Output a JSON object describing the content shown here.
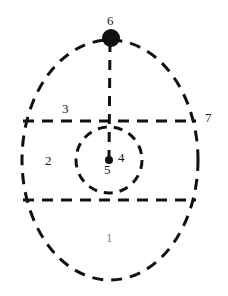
{
  "figure": {
    "title": "",
    "background_color": "#ffffff",
    "stroke_color": "#111111",
    "label_color": "#1a1a1a",
    "faint_label_color": "#8a8a8a"
  },
  "shapes": {
    "outer_ellipse": {
      "name": "outer-ellipse",
      "center_x": 110,
      "center_y": 160,
      "radius_x": 88,
      "radius_y": 120,
      "style": "dashed"
    },
    "inner_circle": {
      "name": "inner-circle",
      "center_x": 109,
      "center_y": 160,
      "radius": 33,
      "style": "dashed"
    },
    "upper_horizontal_line": {
      "name": "upper-horizontal-line",
      "x1": 23,
      "y1": 121,
      "x2": 196,
      "y2": 121,
      "style": "dashed"
    },
    "lower_horizontal_line": {
      "name": "lower-horizontal-line",
      "x1": 23,
      "y1": 200,
      "x2": 196,
      "y2": 200,
      "style": "dashed"
    },
    "vertical_line": {
      "name": "vertical-axis-line",
      "x1": 110,
      "y1": 42,
      "x2": 109,
      "y2": 160,
      "style": "dashed"
    },
    "top_dot": {
      "name": "top-vertex-dot",
      "center_x": 111,
      "center_y": 38,
      "radius": 9,
      "fill": "#111111"
    },
    "center_dot": {
      "name": "center-point-dot",
      "center_x": 109,
      "center_y": 160,
      "radius": 4,
      "fill": "#111111"
    }
  },
  "labels": [
    {
      "id": "1",
      "text": "1",
      "region": "lower-region",
      "x": 110,
      "y": 238,
      "faint": true
    },
    {
      "id": "2",
      "text": "2",
      "region": "middle-band-left",
      "x": 48,
      "y": 161,
      "faint": false
    },
    {
      "id": "3",
      "text": "3",
      "region": "upper-region",
      "x": 66,
      "y": 109,
      "faint": false
    },
    {
      "id": "4",
      "text": "4",
      "region": "inner-circle-right",
      "x": 122,
      "y": 158,
      "faint": false
    },
    {
      "id": "5",
      "text": "5",
      "region": "center-point",
      "x": 108,
      "y": 170,
      "faint": false
    },
    {
      "id": "6",
      "text": "6",
      "region": "top-vertex",
      "x": 111,
      "y": 21,
      "faint": false
    },
    {
      "id": "7",
      "text": "7",
      "region": "outside-right",
      "x": 209,
      "y": 118,
      "faint": false
    }
  ]
}
